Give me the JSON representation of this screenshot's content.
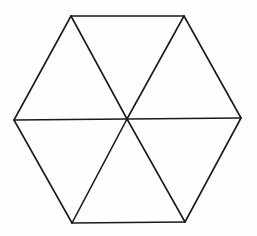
{
  "diagram": {
    "type": "regular-hexagon-divided-into-six-triangles",
    "width": 257,
    "height": 236,
    "background": "#fefefe",
    "stroke_color": "#1a1a1a",
    "stroke_width": 1.6,
    "center": [
      127,
      119
    ],
    "vertices": [
      [
        71,
        16
      ],
      [
        184,
        16
      ],
      [
        241,
        118
      ],
      [
        185,
        222
      ],
      [
        72,
        223
      ],
      [
        14,
        120
      ]
    ],
    "outline_edges": [
      [
        0,
        1
      ],
      [
        1,
        2
      ],
      [
        2,
        3
      ],
      [
        3,
        4
      ],
      [
        4,
        5
      ],
      [
        5,
        0
      ]
    ],
    "spokes_to_center": [
      0,
      1,
      2,
      3,
      4,
      5
    ],
    "triangle_count": 6
  }
}
